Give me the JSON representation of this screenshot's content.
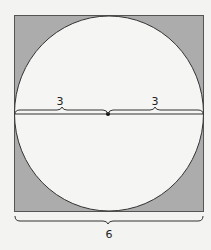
{
  "diagram": {
    "labels": {
      "left_radius": "3",
      "right_radius": "3",
      "side": "6"
    },
    "colors": {
      "background": "#f3f3f1",
      "square_fill": "#acacac",
      "circle_fill": "#f5f5f3",
      "stroke": "#333333"
    }
  }
}
